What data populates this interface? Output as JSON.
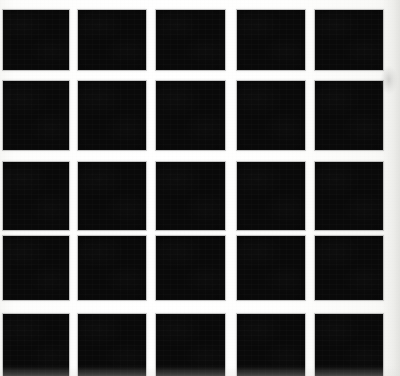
{
  "figure": {
    "canvas": {
      "width": 400,
      "height": 376
    },
    "colors": {
      "square_fill": "#090909",
      "paper_background": "#fdfdfb",
      "gutter_white": "#ffffff",
      "scan_halo": "#787878",
      "edge_shadow": "#d6d6d2"
    },
    "grid": {
      "rows": 5,
      "columns": 5,
      "square_size_px": 66,
      "gutter_px": 11,
      "column_x": [
        3,
        78,
        156,
        237,
        315
      ],
      "row_y": [
        10,
        81,
        162,
        236,
        314
      ],
      "column_widths": [
        66,
        68,
        69,
        68,
        68
      ],
      "row_heights": [
        60,
        69,
        68,
        64,
        62
      ],
      "clipped_edges": [
        "top",
        "bottom",
        "right"
      ]
    },
    "cells": [
      {
        "id": "r1c1",
        "row": 1,
        "col": 1,
        "x": 3,
        "y": 10,
        "w": 66,
        "h": 60
      },
      {
        "id": "r1c2",
        "row": 1,
        "col": 2,
        "x": 78,
        "y": 10,
        "w": 68,
        "h": 60
      },
      {
        "id": "r1c3",
        "row": 1,
        "col": 3,
        "x": 156,
        "y": 10,
        "w": 69,
        "h": 60
      },
      {
        "id": "r1c4",
        "row": 1,
        "col": 4,
        "x": 237,
        "y": 10,
        "w": 68,
        "h": 60
      },
      {
        "id": "r1c5",
        "row": 1,
        "col": 5,
        "x": 315,
        "y": 10,
        "w": 68,
        "h": 60
      },
      {
        "id": "r2c1",
        "row": 2,
        "col": 1,
        "x": 3,
        "y": 81,
        "w": 66,
        "h": 69
      },
      {
        "id": "r2c2",
        "row": 2,
        "col": 2,
        "x": 78,
        "y": 81,
        "w": 68,
        "h": 69
      },
      {
        "id": "r2c3",
        "row": 2,
        "col": 3,
        "x": 156,
        "y": 81,
        "w": 69,
        "h": 69
      },
      {
        "id": "r2c4",
        "row": 2,
        "col": 4,
        "x": 237,
        "y": 81,
        "w": 68,
        "h": 69
      },
      {
        "id": "r2c5",
        "row": 2,
        "col": 5,
        "x": 315,
        "y": 81,
        "w": 68,
        "h": 69
      },
      {
        "id": "r3c1",
        "row": 3,
        "col": 1,
        "x": 3,
        "y": 162,
        "w": 66,
        "h": 68
      },
      {
        "id": "r3c2",
        "row": 3,
        "col": 2,
        "x": 78,
        "y": 162,
        "w": 68,
        "h": 68
      },
      {
        "id": "r3c3",
        "row": 3,
        "col": 3,
        "x": 156,
        "y": 162,
        "w": 69,
        "h": 68
      },
      {
        "id": "r3c4",
        "row": 3,
        "col": 4,
        "x": 237,
        "y": 162,
        "w": 68,
        "h": 68
      },
      {
        "id": "r3c5",
        "row": 3,
        "col": 5,
        "x": 315,
        "y": 162,
        "w": 68,
        "h": 68
      },
      {
        "id": "r4c1",
        "row": 4,
        "col": 1,
        "x": 3,
        "y": 236,
        "w": 66,
        "h": 64
      },
      {
        "id": "r4c2",
        "row": 4,
        "col": 2,
        "x": 78,
        "y": 236,
        "w": 68,
        "h": 64
      },
      {
        "id": "r4c3",
        "row": 4,
        "col": 3,
        "x": 156,
        "y": 236,
        "w": 69,
        "h": 64
      },
      {
        "id": "r4c4",
        "row": 4,
        "col": 4,
        "x": 237,
        "y": 236,
        "w": 68,
        "h": 64
      },
      {
        "id": "r4c5",
        "row": 4,
        "col": 5,
        "x": 315,
        "y": 236,
        "w": 68,
        "h": 64
      },
      {
        "id": "r5c1",
        "row": 5,
        "col": 1,
        "x": 3,
        "y": 314,
        "w": 66,
        "h": 62
      },
      {
        "id": "r5c2",
        "row": 5,
        "col": 2,
        "x": 78,
        "y": 314,
        "w": 68,
        "h": 62
      },
      {
        "id": "r5c3",
        "row": 5,
        "col": 3,
        "x": 156,
        "y": 314,
        "w": 69,
        "h": 62
      },
      {
        "id": "r5c4",
        "row": 5,
        "col": 4,
        "x": 237,
        "y": 314,
        "w": 68,
        "h": 62
      },
      {
        "id": "r5c5",
        "row": 5,
        "col": 5,
        "x": 315,
        "y": 314,
        "w": 68,
        "h": 62
      }
    ],
    "artifacts": [
      {
        "id": "right-margin-smudge",
        "x": 378,
        "y": 62,
        "w": 22,
        "h": 36
      }
    ]
  }
}
